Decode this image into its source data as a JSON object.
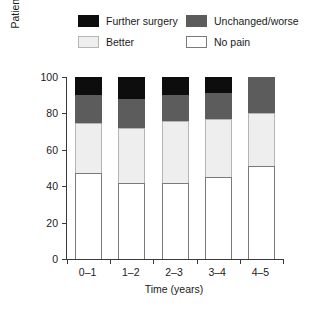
{
  "chart_data": {
    "type": "bar",
    "stacked": true,
    "title": "",
    "xlabel": "Time (years)",
    "ylabel": "Patients (%)",
    "categories": [
      "0–1",
      "1–2",
      "2–3",
      "3–4",
      "4–5"
    ],
    "ylim": [
      0,
      100
    ],
    "yticks": [
      0,
      20,
      40,
      60,
      80,
      100
    ],
    "ytick_labels": [
      "0",
      "20",
      "40",
      "60",
      "80",
      "100"
    ],
    "grid": false,
    "legend_position": "top",
    "series": [
      {
        "name": "No pain",
        "color": "#ffffff",
        "edge_color": "#7a7a7a",
        "values": [
          47,
          42,
          42,
          45,
          51
        ]
      },
      {
        "name": "Better",
        "color": "#eeeeee",
        "edge_color": "#b5b5b5",
        "values": [
          28,
          30,
          34,
          32,
          29
        ]
      },
      {
        "name": "Unchanged/worse",
        "color": "#5c5c5c",
        "edge_color": "#5c5c5c",
        "values": [
          15,
          16,
          14,
          14,
          20
        ]
      },
      {
        "name": "Further surgery",
        "color": "#0d0d0d",
        "edge_color": "#0d0d0d",
        "values": [
          10,
          12,
          10,
          9,
          0
        ]
      }
    ],
    "cumulative_tops": [
      [
        47,
        75,
        90,
        100
      ],
      [
        42,
        72,
        88,
        100
      ],
      [
        42,
        76,
        90,
        100
      ],
      [
        45,
        77,
        91,
        100
      ],
      [
        51,
        80,
        100,
        100
      ]
    ]
  },
  "legend": {
    "rows": [
      [
        {
          "label": "Further surgery",
          "swatch_name": "further-surgery"
        },
        {
          "label": "Unchanged/worse",
          "swatch_name": "unchanged-worse"
        }
      ],
      [
        {
          "label": "Better",
          "swatch_name": "better"
        },
        {
          "label": "No pain",
          "swatch_name": "no-pain"
        }
      ]
    ]
  },
  "colors": {
    "further_surgery": "#0d0d0d",
    "unchanged_worse": "#5c5c5c",
    "better": "#eeeeee",
    "no_pain": "#ffffff",
    "axis": "#3a3a3a",
    "text": "#1a1a1a",
    "background": "#ffffff"
  }
}
